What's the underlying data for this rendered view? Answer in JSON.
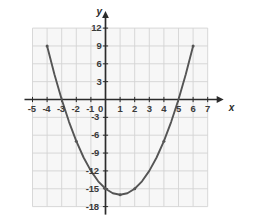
{
  "chart_data": {
    "type": "line",
    "title": "",
    "xlabel": "x",
    "ylabel": "y",
    "equation": "y = x^2 - 2x - 15",
    "xlim": [
      -5.6,
      7.6
    ],
    "ylim": [
      -18.8,
      13.2
    ],
    "grid": true,
    "legend": "none",
    "x_ticks": [
      -5,
      -4,
      -3,
      -2,
      -1,
      1,
      2,
      3,
      4,
      5,
      6,
      7
    ],
    "x_tick_labels": [
      "-5",
      "-4",
      "-3",
      "-2",
      "-1",
      "1",
      "2",
      "3",
      "4",
      "5",
      "6",
      "7"
    ],
    "y_ticks": [
      12,
      9,
      6,
      3,
      -3,
      -6,
      -9,
      -12,
      -15,
      -18
    ],
    "y_tick_labels": [
      "12",
      "9",
      "6",
      "3",
      "-3",
      "-6",
      "-9",
      "-12",
      "-15",
      "-18"
    ],
    "origin_label": "0",
    "x_range_grid": [
      -5,
      7
    ],
    "y_range_grid": [
      -18,
      12
    ],
    "series": [
      {
        "name": "parabola",
        "color": "#555555",
        "x": [
          -4,
          -3.5,
          -3,
          -2.5,
          -2,
          -1.5,
          -1,
          -0.5,
          0,
          0.5,
          1,
          1.5,
          2,
          2.5,
          3,
          3.5,
          4,
          4.5,
          5,
          5.5,
          6
        ],
        "y": [
          9,
          4.25,
          0,
          -3.75,
          -7,
          -9.75,
          -12,
          -13.75,
          -15,
          -15.75,
          -16,
          -15.75,
          -15,
          -13.75,
          -12,
          -9.75,
          -7,
          -3.75,
          0,
          4.25,
          9
        ]
      }
    ],
    "marked_points": [
      {
        "x": -4,
        "y": 9
      },
      {
        "x": -2,
        "y": -7
      },
      {
        "x": 0,
        "y": -15
      },
      {
        "x": 1,
        "y": -16
      },
      {
        "x": 2,
        "y": -15
      },
      {
        "x": 4,
        "y": -7
      },
      {
        "x": 6,
        "y": 9
      }
    ],
    "roots": [
      -3,
      5
    ],
    "vertex": {
      "x": 1,
      "y": -16
    },
    "colors": {
      "curve": "#555555",
      "axis": "#2b2b2b",
      "grid": "#d4d4d4",
      "plot_background": "#f7f7f7",
      "label": "#3a3a3a"
    }
  }
}
